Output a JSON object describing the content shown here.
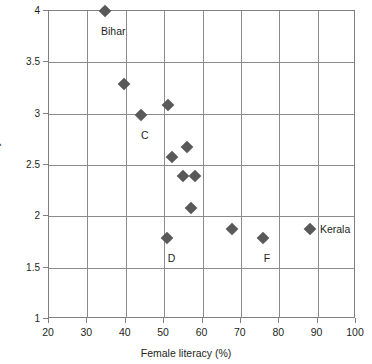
{
  "chart_data": {
    "type": "scatter",
    "title": "",
    "xlabel": "Female literacy (%)",
    "ylabel": "Fertility",
    "xlim": [
      20,
      100
    ],
    "ylim": [
      1,
      4
    ],
    "xticks": [
      20,
      30,
      40,
      50,
      60,
      70,
      80,
      90,
      100
    ],
    "yticks": [
      1,
      1.5,
      2,
      2.5,
      3,
      3.5,
      4
    ],
    "xtick_labels": [
      "20",
      "30",
      "40",
      "50",
      "60",
      "70",
      "80",
      "90",
      "100"
    ],
    "ytick_labels": [
      "1",
      "1.5",
      "2",
      "2.5",
      "3",
      "3.5",
      "4"
    ],
    "grid": true,
    "legend": "none",
    "marker_shape": "diamond",
    "marker_color": "#595959",
    "points": [
      {
        "x": 34.6,
        "y": 4.0,
        "label": "Bihar",
        "label_dx": -4,
        "label_dy": 20
      },
      {
        "x": 39.5,
        "y": 3.29,
        "label": "",
        "label_dx": 0,
        "label_dy": 0
      },
      {
        "x": 44.0,
        "y": 2.99,
        "label": "C",
        "label_dx": 0,
        "label_dy": 20
      },
      {
        "x": 51.0,
        "y": 3.08,
        "label": "",
        "label_dx": 0,
        "label_dy": 0
      },
      {
        "x": 52.0,
        "y": 2.58,
        "label": "",
        "label_dx": 0,
        "label_dy": 0
      },
      {
        "x": 56.0,
        "y": 2.68,
        "label": "",
        "label_dx": 0,
        "label_dy": 0
      },
      {
        "x": 55.0,
        "y": 2.39,
        "label": "",
        "label_dx": 0,
        "label_dy": 0
      },
      {
        "x": 58.0,
        "y": 2.39,
        "label": "",
        "label_dx": 0,
        "label_dy": 0
      },
      {
        "x": 57.0,
        "y": 2.08,
        "label": "",
        "label_dx": 0,
        "label_dy": 0
      },
      {
        "x": 50.7,
        "y": 1.79,
        "label": "D",
        "label_dx": 1,
        "label_dy": 20
      },
      {
        "x": 67.8,
        "y": 1.88,
        "label": "",
        "label_dx": 0,
        "label_dy": 0
      },
      {
        "x": 75.7,
        "y": 1.79,
        "label": "F",
        "label_dx": 1,
        "label_dy": 20
      },
      {
        "x": 88.0,
        "y": 1.88,
        "label": "Kerala",
        "label_dx": 10,
        "label_dy": 0
      }
    ]
  }
}
